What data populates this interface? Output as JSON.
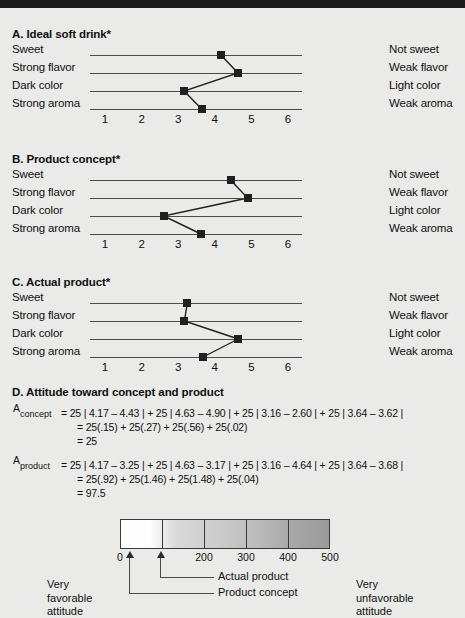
{
  "page": {
    "background": "#eaeae8",
    "topbar_color": "#1a1a1a"
  },
  "charts": [
    {
      "id": "A",
      "title": "A. Ideal soft drink*",
      "left_labels": [
        "Sweet",
        "Strong flavor",
        "Dark color",
        "Strong aroma"
      ],
      "right_labels": [
        "Not sweet",
        "Weak flavor",
        "Light color",
        "Weak aroma"
      ],
      "ticks": [
        "1",
        "2",
        "3",
        "4",
        "5",
        "6"
      ],
      "values": [
        4.17,
        4.63,
        3.16,
        3.64
      ]
    },
    {
      "id": "B",
      "title": "B. Product concept*",
      "left_labels": [
        "Sweet",
        "Strong flavor",
        "Dark color",
        "Strong aroma"
      ],
      "right_labels": [
        "Not sweet",
        "Weak flavor",
        "Light color",
        "Weak aroma"
      ],
      "ticks": [
        "1",
        "2",
        "3",
        "4",
        "5",
        "6"
      ],
      "values": [
        4.43,
        4.9,
        2.6,
        3.62
      ]
    },
    {
      "id": "C",
      "title": "C. Actual product*",
      "left_labels": [
        "Sweet",
        "Strong flavor",
        "Dark color",
        "Strong aroma"
      ],
      "right_labels": [
        "Not sweet",
        "Weak flavor",
        "Light color",
        "Weak aroma"
      ],
      "ticks": [
        "1",
        "2",
        "3",
        "4",
        "5",
        "6"
      ],
      "values": [
        3.25,
        3.17,
        4.64,
        3.68
      ]
    }
  ],
  "chart_data": {
    "type": "line",
    "xlabel": "",
    "ylabel": "",
    "xlim": [
      1,
      6
    ],
    "grid": false,
    "legend": "none",
    "categories": [
      "Sweet / Not sweet",
      "Strong flavor / Weak flavor",
      "Dark color / Light color",
      "Strong aroma / Weak aroma"
    ],
    "xticks": [
      1,
      2,
      3,
      4,
      5,
      6
    ],
    "series": [
      {
        "name": "A. Ideal soft drink*",
        "values": [
          4.17,
          4.63,
          3.16,
          3.64
        ]
      },
      {
        "name": "B. Product concept*",
        "values": [
          4.43,
          4.9,
          2.6,
          3.62
        ]
      },
      {
        "name": "C. Actual product*",
        "values": [
          3.25,
          3.17,
          4.64,
          3.68
        ]
      }
    ],
    "scale": {
      "type": "heatmap",
      "title": "Attitude scale",
      "min": 0,
      "max": 500,
      "ticks": [
        0,
        200,
        300,
        400,
        500
      ],
      "segments": [
        0,
        100,
        200,
        300,
        400,
        500
      ],
      "low_label": "Very favorable attitude",
      "high_label": "Very unfavorable attitude",
      "markers": [
        {
          "label": "Product concept",
          "value": 25
        },
        {
          "label": "Actual product",
          "value": 97.5
        }
      ]
    }
  },
  "section_d": {
    "title": "D. Attitude toward concept and product",
    "concept": {
      "symbol": "A",
      "subscript": "concept",
      "line1": "= 25 | 4.17 – 4.43 | + 25 | 4.63 – 4.90 | + 25 | 3.16 – 2.60 | + 25 | 3.64 – 3.62 |",
      "line2": "= 25(.15) + 25(.27) + 25(.56) + 25(.02)",
      "line3": "= 25"
    },
    "product": {
      "symbol": "A",
      "subscript": "product",
      "line1": "= 25 | 4.17 – 3.25 | + 25 | 4.63 – 3.17 | + 25 | 3.16 – 4.64 | + 25 | 3.64 – 3.68 |",
      "line2": "= 25(.92) + 25(1.46) + 25(1.48) + 25(.04)",
      "line3": "= 97.5"
    }
  },
  "scale": {
    "numbers": [
      "0",
      "200",
      "300",
      "400",
      "500"
    ],
    "callout_actual": "Actual product",
    "callout_concept": "Product concept",
    "left_label_line1": "Very",
    "left_label_line2": "favorable",
    "left_label_line3": "attitude",
    "right_label_line1": "Very",
    "right_label_line2": "unfavorable",
    "right_label_line3": "attitude"
  }
}
